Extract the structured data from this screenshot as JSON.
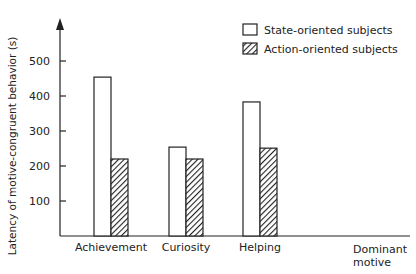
{
  "chart_data": {
    "type": "bar",
    "title": "",
    "xlabel": "Dominant motive",
    "ylabel": "Latency of motive-congruent behavior (s)",
    "categories": [
      "Achievement",
      "Curiosity",
      "Helping"
    ],
    "series": [
      {
        "name": "State-oriented subjects",
        "values": [
          454,
          254,
          383
        ],
        "fill": "#ffffff"
      },
      {
        "name": "Action-oriented subjects",
        "values": [
          220,
          220,
          251
        ],
        "fill": "hatched"
      }
    ],
    "yticks": [
      100,
      200,
      300,
      400,
      500
    ],
    "ylim": [
      0,
      560
    ],
    "grid": false,
    "legend_position": "top-right"
  },
  "legend": {
    "state_label": "State-oriented subjects",
    "action_label": "Action-oriented subjects"
  },
  "axis": {
    "ylabel": "Latency of motive-congruent behavior (s)",
    "xlabel_line1": "Dominant",
    "xlabel_line2": "motive"
  }
}
